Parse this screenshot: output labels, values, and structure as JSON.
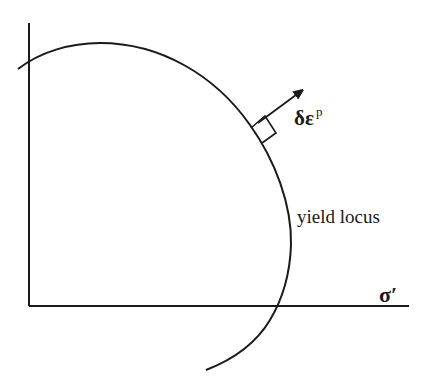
{
  "diagram": {
    "type": "yield-surface-normality",
    "axes": {
      "x_label": "σ′",
      "y_label": ""
    },
    "curve": {
      "label": "yield locus"
    },
    "normal_vector": {
      "label_main": "δε",
      "label_superscript": "p"
    },
    "colors": {
      "stroke": "#1a1a1a",
      "background": "#ffffff"
    }
  }
}
